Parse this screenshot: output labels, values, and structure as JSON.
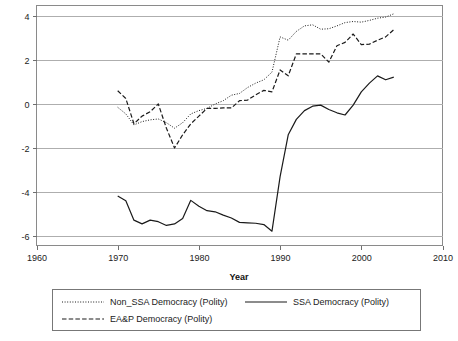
{
  "chart_data": {
    "type": "line",
    "title": "",
    "xlabel": "Year",
    "ylabel": "",
    "xlim": [
      1960,
      2010
    ],
    "ylim": [
      -6.6,
      4.4
    ],
    "xticks": [
      1960,
      1970,
      1980,
      1990,
      2000,
      2010
    ],
    "yticks": [
      4,
      2,
      0,
      -2,
      -4,
      -6
    ],
    "grid": true,
    "legend_position": "below-plot",
    "series": [
      {
        "name": "Non_SSA Democracy (Polity)",
        "style": "dotted",
        "x": [
          1970,
          1971,
          1972,
          1973,
          1974,
          1975,
          1976,
          1977,
          1978,
          1979,
          1980,
          1981,
          1982,
          1983,
          1984,
          1985,
          1986,
          1987,
          1988,
          1989,
          1990,
          1991,
          1992,
          1993,
          1994,
          1995,
          1996,
          1997,
          1998,
          1999,
          2000,
          2001,
          2002,
          2003,
          2004
        ],
        "values": [
          -0.15,
          -0.45,
          -0.95,
          -0.8,
          -0.72,
          -0.68,
          -0.85,
          -1.1,
          -0.85,
          -0.45,
          -0.3,
          -0.2,
          0.0,
          0.15,
          0.4,
          0.48,
          0.75,
          0.95,
          1.1,
          1.45,
          3.05,
          2.9,
          3.3,
          3.55,
          3.6,
          3.4,
          3.42,
          3.55,
          3.7,
          3.75,
          3.72,
          3.8,
          3.9,
          3.95,
          4.1
        ]
      },
      {
        "name": "EA&P Democracy (Polity)",
        "style": "dashed",
        "x": [
          1970,
          1971,
          1972,
          1973,
          1974,
          1975,
          1976,
          1977,
          1978,
          1979,
          1980,
          1981,
          1982,
          1983,
          1984,
          1985,
          1986,
          1987,
          1988,
          1989,
          1990,
          1991,
          1992,
          1993,
          1994,
          1995,
          1996,
          1997,
          1998,
          1999,
          2000,
          2001,
          2002,
          2003,
          2004
        ],
        "values": [
          0.6,
          0.25,
          -0.9,
          -0.55,
          -0.35,
          0.0,
          -1.1,
          -2.0,
          -1.4,
          -0.9,
          -0.55,
          -0.2,
          -0.2,
          -0.18,
          -0.18,
          0.15,
          0.18,
          0.42,
          0.62,
          0.55,
          1.55,
          1.28,
          2.28,
          2.28,
          2.28,
          2.28,
          1.9,
          2.65,
          2.8,
          3.18,
          2.7,
          2.72,
          2.9,
          3.05,
          3.38
        ]
      },
      {
        "name": "SSA Democracy (Polity)",
        "style": "solid",
        "x": [
          1970,
          1971,
          1972,
          1973,
          1974,
          1975,
          1976,
          1977,
          1978,
          1979,
          1980,
          1981,
          1982,
          1983,
          1984,
          1985,
          1986,
          1987,
          1988,
          1989,
          1990,
          1991,
          1992,
          1993,
          1994,
          1995,
          1996,
          1997,
          1998,
          1999,
          2000,
          2001,
          2002,
          2003,
          2004
        ],
        "values": [
          -4.18,
          -4.4,
          -5.28,
          -5.45,
          -5.28,
          -5.35,
          -5.52,
          -5.45,
          -5.2,
          -4.38,
          -4.65,
          -4.85,
          -4.9,
          -5.05,
          -5.18,
          -5.38,
          -5.4,
          -5.42,
          -5.48,
          -5.78,
          -3.3,
          -1.4,
          -0.7,
          -0.3,
          -0.1,
          -0.05,
          -0.25,
          -0.4,
          -0.5,
          -0.05,
          0.55,
          0.95,
          1.28,
          1.1,
          1.22
        ]
      }
    ]
  },
  "legend": {
    "entries": [
      {
        "label": "Non_SSA Democracy (Polity)",
        "style": "dotted"
      },
      {
        "label": "SSA Democracy (Polity)",
        "style": "solid"
      },
      {
        "label": "EA&P Democracy (Polity)",
        "style": "dashed"
      }
    ]
  },
  "axis": {
    "x_title": "Year",
    "x_tick_labels": [
      "1960",
      "1970",
      "1980",
      "1990",
      "2000",
      "2010"
    ],
    "y_tick_labels": [
      "4",
      "2",
      "0",
      "-2",
      "-4",
      "-6"
    ]
  },
  "colors": {
    "line": "#1a1a1a",
    "grid": "#aeaeae",
    "frame": "#8a8a8a",
    "background": "#ffffff"
  }
}
